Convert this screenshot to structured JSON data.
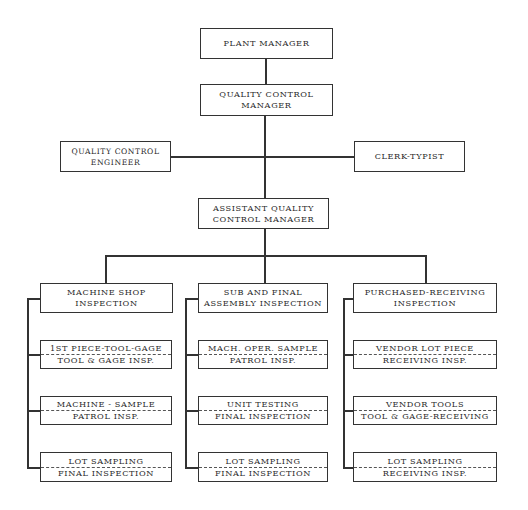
{
  "chart_title": "",
  "nodes": {
    "plant_manager": {
      "line1": "PLANT MANAGER"
    },
    "qc_manager": {
      "line1": "QUALITY CONTROL",
      "line2": "MANAGER"
    },
    "qc_engineer": {
      "line1": "QUALITY CONTROL",
      "line2": "ENGINEER"
    },
    "clerk_typist": {
      "line1": "CLERK-TYPIST"
    },
    "asst_qc_manager": {
      "line1": "ASSISTANT QUALITY",
      "line2": "CONTROL MANAGER"
    }
  },
  "columns": [
    {
      "header": {
        "line1": "MACHINE SHOP",
        "line2": "INSPECTION"
      },
      "items": [
        {
          "line1": "1ST PIECE-TOOL-GAGE",
          "line2": "TOOL & GAGE INSP."
        },
        {
          "line1": "MACHINE - SAMPLE",
          "line2": "PATROL INSP."
        },
        {
          "line1": "LOT SAMPLING",
          "line2": "FINAL INSPECTION"
        }
      ]
    },
    {
      "header": {
        "line1": "SUB AND FINAL",
        "line2": "ASSEMBLY INSPECTION"
      },
      "items": [
        {
          "line1": "MACH. OPER. SAMPLE",
          "line2": "PATROL INSP."
        },
        {
          "line1": "UNIT TESTING",
          "line2": "FINAL INSPECTION"
        },
        {
          "line1": "LOT SAMPLING",
          "line2": "FINAL INSPECTION"
        }
      ]
    },
    {
      "header": {
        "line1": "PURCHASED-RECEIVING",
        "line2": "INSPECTION"
      },
      "items": [
        {
          "line1": "VENDOR LOT PIECE",
          "line2": "RECEIVING INSP."
        },
        {
          "line1": "VENDOR TOOLS",
          "line2": "TOOL & GAGE-RECEIVING"
        },
        {
          "line1": "LOT SAMPLING",
          "line2": "RECEIVING INSP."
        }
      ]
    }
  ],
  "colors": {
    "line": "#333333",
    "background": "#ffffff",
    "text": "#2a2a2a"
  }
}
